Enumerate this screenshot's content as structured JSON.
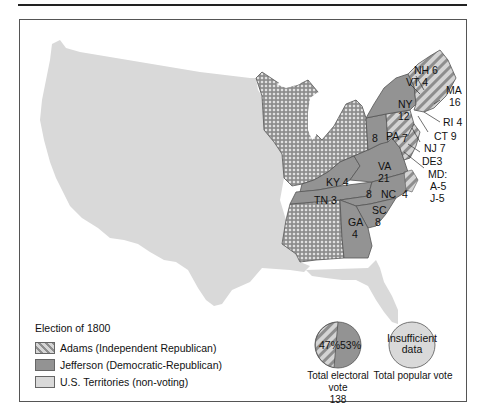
{
  "title": "Election of 1800",
  "colors": {
    "adams": "#c8c8c8",
    "adams_stripe": "#8e8e8e",
    "jefferson": "#939393",
    "territories": "#d9d9d9",
    "border": "#555555"
  },
  "legend": {
    "title": "Election of 1800",
    "items": [
      {
        "label": "Adams (Independent Republican)",
        "pattern": "hatched"
      },
      {
        "label": "Jefferson (Democratic-Republican)",
        "pattern": "solid-dark"
      },
      {
        "label": "U.S. Territories (non-voting)",
        "pattern": "solid-light"
      }
    ]
  },
  "states": {
    "NH": "NH 6",
    "VT": "VT 4",
    "MA": "MA",
    "MA_votes": "16",
    "RI": "RI 4",
    "CT": "CT 9",
    "NY": "NY",
    "NY_votes": "12",
    "PA": "PA",
    "PA_adams": "7",
    "PA_jefferson": "8",
    "NJ": "NJ 7",
    "DE": "DE3",
    "MD": "MD:",
    "MD_adams": "A-5",
    "MD_jefferson": "J-5",
    "VA": "VA",
    "VA_votes": "21",
    "KY": "KY 4",
    "TN": "TN 3",
    "NC": "NC",
    "NC_jefferson": "8",
    "NC_adams": "4",
    "SC": "SC",
    "SC_votes": "8",
    "GA": "GA",
    "GA_votes": "4"
  },
  "pies": {
    "electoral": {
      "adams_pct": "47%",
      "jefferson_pct": "53%",
      "caption": "Total electoral vote",
      "total": "138"
    },
    "popular": {
      "text_line1": "Insufficient",
      "text_line2": "data",
      "caption": "Total popular vote"
    }
  }
}
